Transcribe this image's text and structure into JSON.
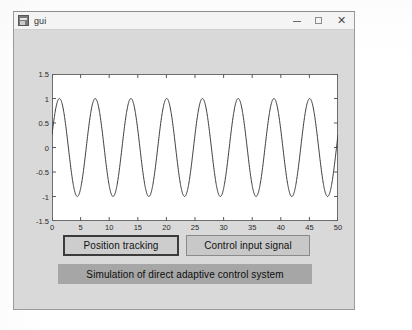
{
  "window": {
    "title": "gui",
    "icon": "app-icon",
    "controls": {
      "minimize": "–",
      "maximize": "□",
      "close": "✕"
    }
  },
  "buttons": {
    "position_tracking": "Position tracking",
    "control_input_signal": "Control input signal"
  },
  "banner": {
    "text": "Simulation of direct adaptive control system"
  },
  "chart_data": {
    "type": "line",
    "title": "",
    "xlabel": "",
    "ylabel": "",
    "xlim": [
      0,
      50
    ],
    "ylim": [
      -1.5,
      1.5
    ],
    "grid": false,
    "legend": null,
    "xticks": [
      0,
      5,
      10,
      15,
      20,
      25,
      30,
      35,
      40,
      45,
      50
    ],
    "yticks": [
      -1.5,
      -1,
      -0.5,
      0,
      0.5,
      1,
      1.5
    ],
    "xtick_labels": [
      "0",
      "5",
      "10",
      "15",
      "20",
      "25",
      "30",
      "35",
      "40",
      "45",
      "50"
    ],
    "ytick_labels": [
      "-1.5",
      "-1",
      "-0.5",
      "0",
      "0.5",
      "1",
      "1.5"
    ],
    "line_color": "#3a3a3a",
    "series": [
      {
        "name": "position tracking",
        "description": "sinusoid, amplitude 1, about 8 cycles over 0 to 50",
        "amplitude": 1,
        "cycles": 8,
        "phase_deg": 15,
        "x": [
          0,
          1,
          2,
          3,
          4,
          5,
          6,
          7,
          8,
          9,
          10,
          11,
          12,
          13,
          14,
          15,
          16,
          17,
          18,
          19,
          20,
          21,
          22,
          23,
          24,
          25,
          26,
          27,
          28,
          29,
          30,
          31,
          32,
          33,
          34,
          35,
          36,
          37,
          38,
          39,
          40,
          41,
          42,
          43,
          44,
          45,
          46,
          47,
          48,
          49,
          50
        ],
        "values": [
          0.26,
          0.87,
          1.0,
          0.56,
          -0.14,
          -0.77,
          -1.0,
          -0.71,
          -0.04,
          0.65,
          0.99,
          0.83,
          0.22,
          -0.5,
          -0.95,
          -0.92,
          -0.39,
          0.35,
          0.9,
          0.98,
          0.53,
          -0.18,
          -0.79,
          -1.0,
          -0.68,
          0.0,
          0.68,
          1.0,
          0.79,
          0.18,
          -0.53,
          -0.98,
          -0.9,
          -0.35,
          0.39,
          0.92,
          0.95,
          0.5,
          -0.22,
          -0.83,
          -0.99,
          -0.65,
          0.04,
          0.71,
          1.0,
          0.77,
          0.14,
          -0.56,
          -1.0,
          -0.87,
          -0.26
        ]
      }
    ]
  }
}
